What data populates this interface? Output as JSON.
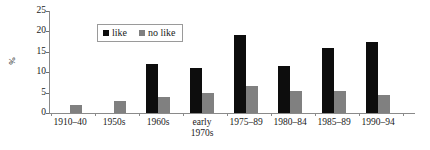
{
  "chart_data": {
    "type": "bar",
    "title": "",
    "xlabel": "",
    "ylabel": "%",
    "ylim": [
      0,
      25
    ],
    "yticks": [
      0,
      5,
      10,
      15,
      20,
      25
    ],
    "grid": false,
    "legend_position": "top-center",
    "categories": [
      "1910–40",
      "1950s",
      "1960s",
      "early 1970s",
      "1975–89",
      "1980–84",
      "1985–89",
      "1990–94"
    ],
    "series": [
      {
        "name": "like",
        "color": "#0d0d0d",
        "values": [
          0,
          0,
          12,
          11,
          19,
          11.5,
          16,
          17.5
        ]
      },
      {
        "name": "no like",
        "color": "#808080",
        "values": [
          2,
          3,
          4,
          5,
          6.5,
          5.5,
          5.5,
          4.5
        ]
      }
    ]
  },
  "axis": {
    "y_title": "%",
    "y_tick_labels": [
      "25",
      "20",
      "15",
      "10",
      "5",
      "0"
    ]
  },
  "legend": {
    "items": [
      {
        "label": "like",
        "color": "#0d0d0d"
      },
      {
        "label": "no like",
        "color": "#808080"
      }
    ]
  },
  "categories_display": [
    {
      "line1": "1910–40",
      "line2": ""
    },
    {
      "line1": "1950s",
      "line2": ""
    },
    {
      "line1": "1960s",
      "line2": ""
    },
    {
      "line1": "early",
      "line2": "1970s"
    },
    {
      "line1": "1975–89",
      "line2": ""
    },
    {
      "line1": "1980–84",
      "line2": ""
    },
    {
      "line1": "1985–89",
      "line2": ""
    },
    {
      "line1": "1990–94",
      "line2": ""
    }
  ]
}
